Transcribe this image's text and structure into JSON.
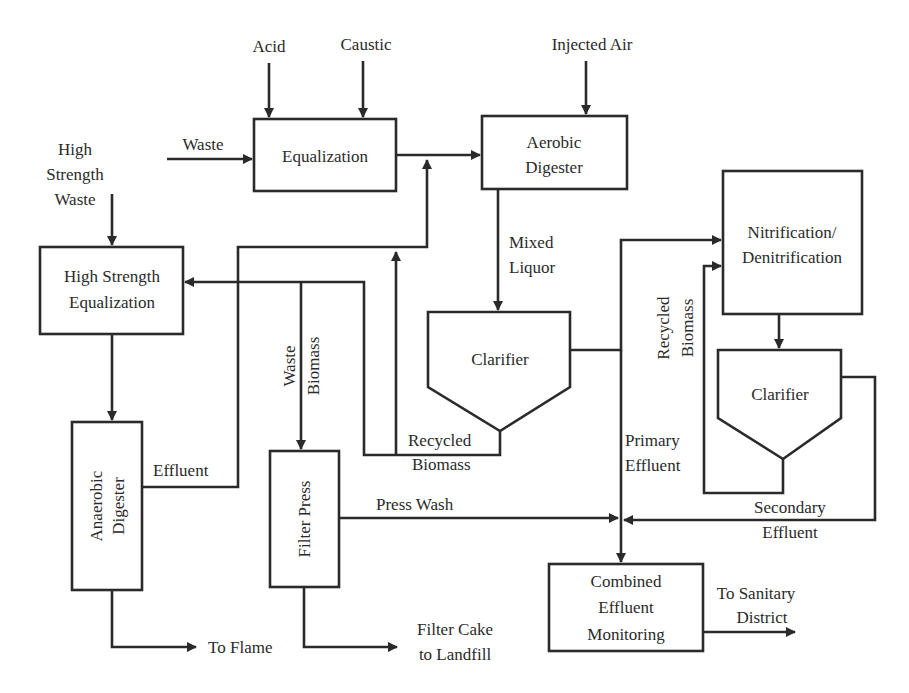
{
  "diagram": {
    "type": "process-flow",
    "colors": {
      "line": "#2a2a2a",
      "background": "#ffffff"
    },
    "inputs": {
      "acid": "Acid",
      "caustic": "Caustic",
      "injected_air": "Injected Air",
      "waste": "Waste",
      "high_strength_waste": [
        "High",
        "Strength",
        "Waste"
      ]
    },
    "nodes": {
      "equalization": "Equalization",
      "aerobic_digester": [
        "Aerobic",
        "Digester"
      ],
      "nitrification": [
        "Nitrification/",
        "Denitrification"
      ],
      "clarifier_1": "Clarifier",
      "clarifier_2": "Clarifier",
      "hs_equalization": [
        "High Strength",
        "Equalization"
      ],
      "anaerobic_digester": [
        "Anaerobic",
        "Digester"
      ],
      "filter_press": "Filter Press",
      "combined_monitoring": [
        "Combined",
        "Effluent",
        "Monitoring"
      ]
    },
    "labels": {
      "mixed_liquor": [
        "Mixed",
        "Liquor"
      ],
      "recycled_biomass_1": [
        "Recycled",
        "Biomass"
      ],
      "recycled_biomass_2": [
        "Recycled",
        "Biomass"
      ],
      "waste_biomass": [
        "Waste",
        "Biomass"
      ],
      "effluent": "Effluent",
      "primary_effluent": [
        "Primary",
        "Effluent"
      ],
      "secondary_effluent": [
        "Secondary",
        "Effluent"
      ],
      "press_wash": "Press Wash"
    },
    "outputs": {
      "to_flame": "To Flame",
      "filter_cake": [
        "Filter Cake",
        "to Landfill"
      ],
      "to_sanitary": [
        "To Sanitary",
        "District"
      ]
    }
  }
}
